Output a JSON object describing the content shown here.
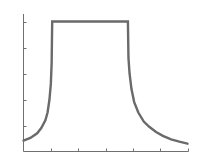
{
  "chart_data": {
    "type": "line",
    "title": "",
    "xlabel": "",
    "ylabel": "",
    "xlim": [
      0,
      6
    ],
    "ylim": [
      0,
      5
    ],
    "xticks": [
      1,
      2,
      3,
      4,
      5,
      6
    ],
    "yticks": [
      1,
      2,
      3,
      4,
      5
    ],
    "xtick_labels": [],
    "ytick_labels": [],
    "grid": false,
    "legend": null,
    "series": [
      {
        "name": "curve",
        "color": "#6a6a6a",
        "x": [
          0,
          0.25,
          0.5,
          0.65,
          0.8,
          0.88,
          0.95,
          1.0,
          1.03,
          1.05,
          3.82,
          3.84,
          3.88,
          3.95,
          4.05,
          4.2,
          4.4,
          4.6,
          4.85,
          5.1,
          5.4,
          5.7,
          6.0
        ],
        "values": [
          0.42,
          0.52,
          0.7,
          0.9,
          1.2,
          1.5,
          2.0,
          2.6,
          3.4,
          5.0,
          5.0,
          3.6,
          3.0,
          2.4,
          1.9,
          1.5,
          1.15,
          0.95,
          0.75,
          0.6,
          0.47,
          0.38,
          0.3
        ]
      }
    ]
  }
}
